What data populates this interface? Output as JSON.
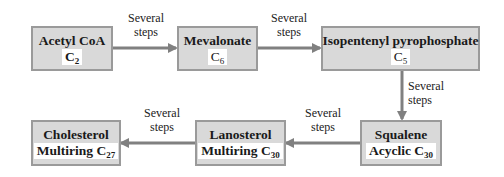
{
  "diagram": {
    "colors": {
      "box_fill": "#d9d9d9",
      "box_border": "#9a9a9a",
      "arrow": "#808080",
      "background": "#ffffff"
    },
    "nodes": [
      {
        "id": "acetyl-coa",
        "name": "Acetyl CoA",
        "formula_prefix": "",
        "element": "C",
        "subscript": "2"
      },
      {
        "id": "mevalonate",
        "name": "Mevalonate",
        "formula_prefix": "",
        "element": "C",
        "subscript": "6"
      },
      {
        "id": "isopentenyl-pyrophosphate",
        "name": "Isopentenyl pyrophosphate",
        "formula_prefix": "",
        "element": "C",
        "subscript": "5"
      },
      {
        "id": "squalene",
        "name": "Squalene",
        "formula_prefix": "Acyclic ",
        "element": "C",
        "subscript": "30"
      },
      {
        "id": "lanosterol",
        "name": "Lanosterol",
        "formula_prefix": "Multiring ",
        "element": "C",
        "subscript": "30"
      },
      {
        "id": "cholesterol",
        "name": "Cholesterol",
        "formula_prefix": "Multiring ",
        "element": "C",
        "subscript": "27"
      }
    ],
    "edges": [
      {
        "from": "acetyl-coa",
        "to": "mevalonate",
        "label_line1": "Several",
        "label_line2": "steps"
      },
      {
        "from": "mevalonate",
        "to": "isopentenyl-pyrophosphate",
        "label_line1": "Several",
        "label_line2": "steps"
      },
      {
        "from": "isopentenyl-pyrophosphate",
        "to": "squalene",
        "label_line1": "Several",
        "label_line2": "steps"
      },
      {
        "from": "squalene",
        "to": "lanosterol",
        "label_line1": "Several",
        "label_line2": "steps"
      },
      {
        "from": "lanosterol",
        "to": "cholesterol",
        "label_line1": "Several",
        "label_line2": "steps"
      }
    ]
  }
}
